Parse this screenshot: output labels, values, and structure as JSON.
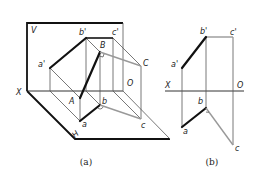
{
  "figure_a": {
    "caption": "(a)",
    "labels": {
      "V": "V",
      "H": "H",
      "X": "X",
      "O": "O",
      "a_prime": "a'",
      "b_prime": "b'",
      "c_prime": "c'",
      "A": "A",
      "B": "B",
      "C": "C",
      "a": "a",
      "b": "b",
      "c": "c"
    }
  },
  "figure_b": {
    "caption": "(b)",
    "labels": {
      "X": "X",
      "O": "O",
      "a_prime": "a'",
      "b_prime": "b'",
      "c_prime": "c'",
      "a": "a",
      "b": "b",
      "c": "c"
    }
  },
  "colors": {
    "line_primary": "#111111",
    "line_secondary": "#999999",
    "projection": "#555555"
  }
}
